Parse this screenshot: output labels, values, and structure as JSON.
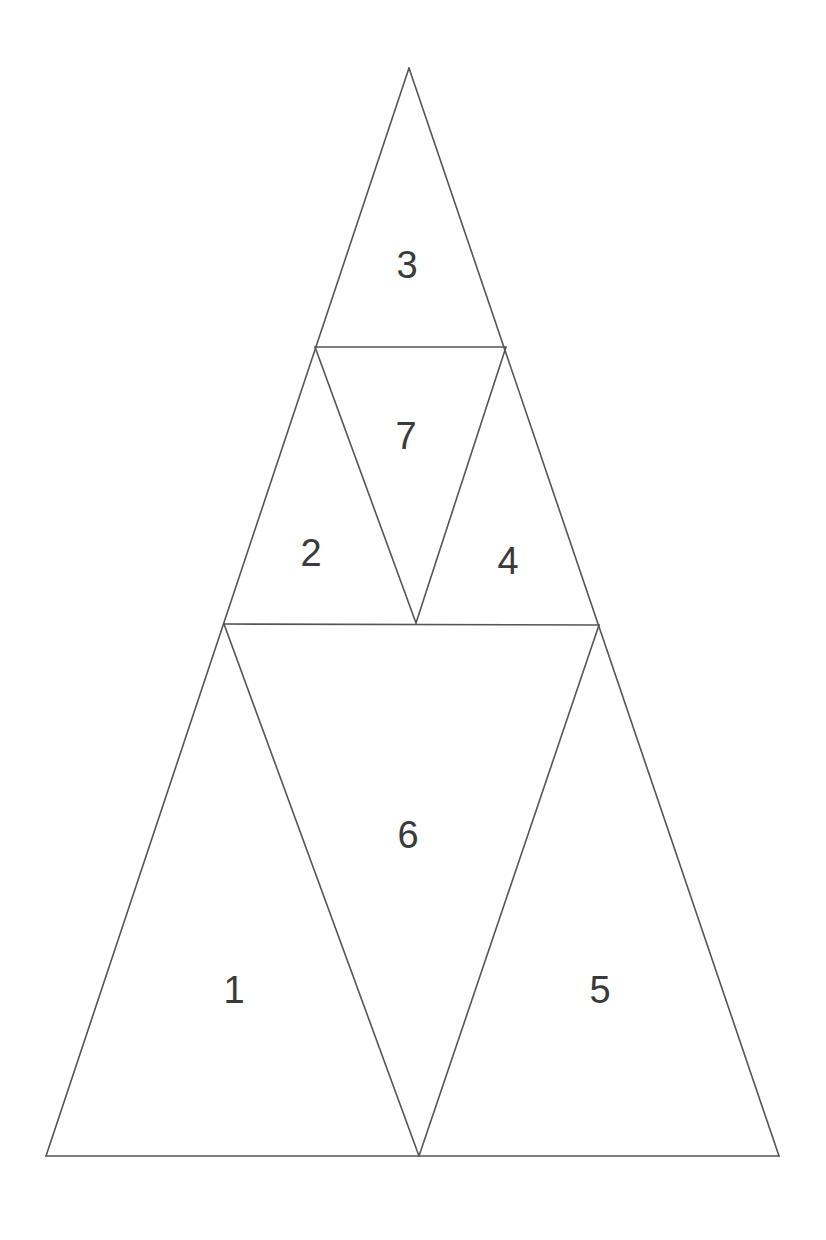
{
  "diagram": {
    "type": "subdivided-triangle",
    "colors": {
      "line": "#555555",
      "label": "#3a3a3a",
      "background": "#ffffff"
    },
    "vertices": {
      "apex": [
        409,
        68
      ],
      "mid_left": [
        315,
        347
      ],
      "mid_right": [
        506,
        347
      ],
      "inner_bottom": [
        416,
        623
      ],
      "low_left": [
        224,
        624
      ],
      "low_right": [
        599,
        625
      ],
      "base_left": [
        46,
        1156
      ],
      "base_center": [
        419,
        1156
      ],
      "base_right": [
        779,
        1156
      ]
    },
    "regions": [
      {
        "id": "1",
        "label": "1",
        "points": "46,1156 224,624 419,1156",
        "label_pos": [
          234,
          990
        ]
      },
      {
        "id": "2",
        "label": "2",
        "points": "224,624 315,347 416,623",
        "label_pos": [
          311,
          553
        ]
      },
      {
        "id": "3",
        "label": "3",
        "points": "409,68 315,347 506,347",
        "label_pos": [
          407,
          265
        ]
      },
      {
        "id": "4",
        "label": "4",
        "points": "506,347 599,625 416,623",
        "label_pos": [
          508,
          561
        ]
      },
      {
        "id": "5",
        "label": "5",
        "points": "599,625 779,1156 419,1156",
        "label_pos": [
          600,
          990
        ]
      },
      {
        "id": "6",
        "label": "6",
        "points": "224,624 599,625 419,1156",
        "label_pos": [
          408,
          835
        ]
      },
      {
        "id": "7",
        "label": "7",
        "points": "315,347 506,347 416,623",
        "label_pos": [
          406,
          436
        ]
      }
    ],
    "edges": [
      [
        46,
        1156,
        779,
        1156
      ],
      [
        46,
        1156,
        409,
        68
      ],
      [
        409,
        68,
        779,
        1156
      ],
      [
        315,
        347,
        506,
        347
      ],
      [
        224,
        624,
        599,
        625
      ],
      [
        315,
        347,
        416,
        623
      ],
      [
        506,
        347,
        416,
        623
      ],
      [
        224,
        624,
        419,
        1156
      ],
      [
        599,
        625,
        419,
        1156
      ]
    ]
  }
}
